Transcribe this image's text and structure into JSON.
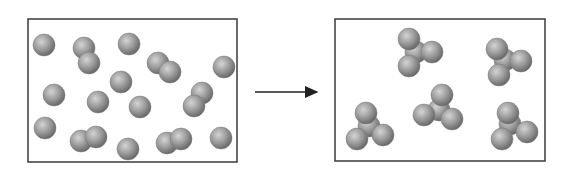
{
  "diagram": {
    "colors": {
      "frame": "#3a3a3a",
      "sphere_light": "#c8c8c8",
      "sphere_mid": "#9a9a9a",
      "sphere_dark": "#6a6a6a",
      "arrow": "#222222"
    },
    "sphere_radius": 11,
    "left_box": {
      "x": 28,
      "y": 19,
      "width": 209,
      "height": 143,
      "atoms": [
        [
          44,
          45
        ],
        [
          84,
          48
        ],
        [
          89,
          63
        ],
        [
          129,
          44
        ],
        [
          158,
          63
        ],
        [
          170,
          72
        ],
        [
          224,
          67
        ],
        [
          54,
          95
        ],
        [
          121,
          82
        ],
        [
          98,
          102
        ],
        [
          140,
          107
        ],
        [
          202,
          93
        ],
        [
          194,
          106
        ],
        [
          45,
          128
        ],
        [
          81,
          141
        ],
        [
          96,
          137
        ],
        [
          128,
          149
        ],
        [
          167,
          143
        ],
        [
          181,
          139
        ],
        [
          221,
          138
        ]
      ]
    },
    "arrow": {
      "x1": 255,
      "y1": 92,
      "x2": 317,
      "y2": 92
    },
    "right_box": {
      "x": 335,
      "y": 19,
      "width": 210,
      "height": 142,
      "molecules": [
        {
          "atoms": [
            [
              416,
              52
            ],
            [
              409,
              39
            ],
            [
              432,
              52
            ],
            [
              409,
              66
            ]
          ]
        },
        {
          "atoms": [
            [
              505,
              60
            ],
            [
              497,
              49
            ],
            [
              521,
              61
            ],
            [
              499,
              75
            ]
          ]
        },
        {
          "atoms": [
            [
              439,
              110
            ],
            [
              442,
              95
            ],
            [
              424,
              115
            ],
            [
              452,
              119
            ]
          ]
        },
        {
          "atoms": [
            [
              369,
              126
            ],
            [
              366,
              113
            ],
            [
              357,
              139
            ],
            [
              383,
              135
            ]
          ]
        },
        {
          "atoms": [
            [
              510,
              124
            ],
            [
              508,
              113
            ],
            [
              527,
              132
            ],
            [
              502,
              139
            ]
          ]
        }
      ]
    }
  }
}
